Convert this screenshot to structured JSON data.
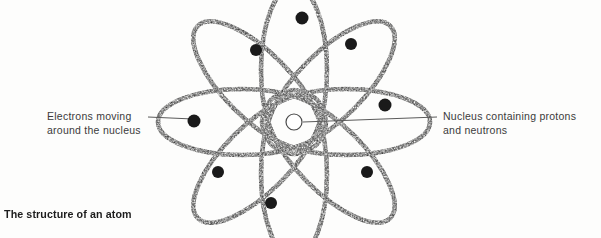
{
  "figure": {
    "caption": "The structure of an atom",
    "title": "The structure of an atom",
    "background_color": "#fdfdfc",
    "ink_color": "#4a4a4a",
    "electron_color": "#1a1a1a",
    "label_color": "#3b3b3b",
    "leader_line_color": "#5a5a5a"
  },
  "labels": {
    "electrons": {
      "line1": "Electrons moving",
      "line2": "around the nucleus",
      "full_text": "Electrons moving around the nucleus",
      "anchor": "left",
      "leader_from_x": 148,
      "leader_to_x": 192,
      "leader_y": 117
    },
    "nucleus": {
      "line1": "Nucleus containing protons",
      "line2": "and neutrons",
      "full_text": "Nucleus containing protons and neutrons",
      "anchor": "right",
      "leader_from_x": 437,
      "leader_to_x": 303,
      "leader_y_start": 117,
      "leader_y_end": 122
    }
  },
  "diagram": {
    "type": "atom-rosette",
    "center": {
      "x": 294,
      "y": 122
    },
    "nucleus": {
      "shape": "circle",
      "radius": 8,
      "stroke": "#4a4a4a",
      "fill": "none"
    },
    "orbit_count": 8,
    "orbit": {
      "semi_major": 84,
      "semi_minor": 33,
      "offset_from_center": 52,
      "angles_deg": [
        0,
        45,
        90,
        135,
        180,
        225,
        270,
        315
      ],
      "style": "stippled",
      "stroke_width": 4.5
    },
    "electron_count": 8,
    "electrons": [
      {
        "id": "e1",
        "x": 302,
        "y": 18,
        "r": 6.5
      },
      {
        "id": "e2",
        "x": 351,
        "y": 44,
        "r": 6.0
      },
      {
        "id": "e3",
        "x": 385,
        "y": 105,
        "r": 6.5
      },
      {
        "id": "e4",
        "x": 367,
        "y": 172,
        "r": 6.0
      },
      {
        "id": "e5",
        "x": 271,
        "y": 203,
        "r": 6.0
      },
      {
        "id": "e6",
        "x": 218,
        "y": 172,
        "r": 6.0
      },
      {
        "id": "e7",
        "x": 194,
        "y": 121,
        "r": 6.5
      },
      {
        "id": "e8",
        "x": 256,
        "y": 50,
        "r": 6.0
      }
    ]
  }
}
